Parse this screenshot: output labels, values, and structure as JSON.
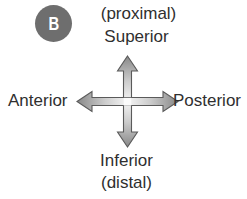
{
  "figure": {
    "width": 247,
    "height": 199,
    "background_color": "#ffffff"
  },
  "panel": {
    "letter": "B",
    "badge_color": "#6e6e6e",
    "letter_color": "#ffffff"
  },
  "labels": {
    "proximal": "(proximal)",
    "superior": "Superior",
    "anterior": "Anterior",
    "posterior": "Posterior",
    "inferior": "Inferior",
    "distal": "(distal)",
    "text_color": "#2f2f2f"
  },
  "arrows": {
    "style": "double-headed",
    "fill_dark": "#8a8a8a",
    "fill_light": "#eeeeee",
    "outline_color": "#5a5a5a",
    "vertical_axis": "Superior-Inferior",
    "horizontal_axis": "Anterior-Posterior"
  }
}
